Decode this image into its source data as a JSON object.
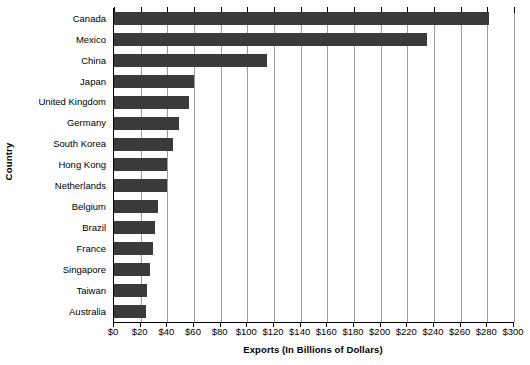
{
  "chart_data": {
    "type": "bar",
    "orientation": "horizontal",
    "title": "",
    "xlabel": "Exports (In Billions of Dollars)",
    "ylabel": "Country",
    "xlim": [
      0,
      300
    ],
    "xtick_step": 20,
    "grid": true,
    "legend": false,
    "bar_color": "#3a3a3a",
    "categories": [
      "Canada",
      "Mexico",
      "China",
      "Japan",
      "United Kingdom",
      "Germany",
      "South Korea",
      "Hong Kong",
      "Netherlands",
      "Belgium",
      "Brazil",
      "France",
      "Singapore",
      "Taiwan",
      "Australia"
    ],
    "values": [
      281,
      235,
      115,
      60,
      56,
      49,
      44,
      40,
      40,
      33,
      31,
      29,
      27,
      25,
      24
    ],
    "xticks": [
      0,
      20,
      40,
      60,
      80,
      100,
      120,
      140,
      160,
      180,
      200,
      220,
      240,
      260,
      280,
      300
    ],
    "xticklabels": [
      "$0",
      "$20",
      "$40",
      "$60",
      "$80",
      "$100",
      "$120",
      "$140",
      "$160",
      "$180",
      "$200",
      "$220",
      "$240",
      "$260",
      "$280",
      "$300"
    ]
  }
}
